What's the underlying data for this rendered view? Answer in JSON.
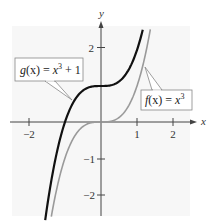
{
  "chart_data": {
    "type": "line",
    "title": "",
    "xlabel": "x",
    "ylabel": "y",
    "xlim": [
      -2.5,
      2.6
    ],
    "ylim": [
      -2.5,
      2.8
    ],
    "x_ticks": [
      -2,
      1,
      2
    ],
    "x_tick_labels": [
      "−2",
      "1",
      "2"
    ],
    "y_ticks": [
      2,
      -1,
      -2
    ],
    "y_tick_labels": [
      "2",
      "−1",
      "−2"
    ],
    "grid": false,
    "series": [
      {
        "name": "g(x) = x³ + 1",
        "formula": "x^3 + 1",
        "color": "#111111",
        "style": "solid-bold",
        "x": [
          -1.55,
          -1.26,
          -1,
          -0.5,
          0,
          0.5,
          1,
          1.16
        ],
        "y": [
          -2.72,
          -1.0,
          0,
          0.875,
          1,
          1.125,
          2,
          2.56
        ]
      },
      {
        "name": "f(x) = x³",
        "formula": "x^3",
        "color": "#999999",
        "style": "solid",
        "x": [
          -1.38,
          -1,
          -0.5,
          0,
          0.5,
          1,
          1.37
        ],
        "y": [
          -2.63,
          -1,
          -0.125,
          0,
          0.125,
          1,
          2.57
        ]
      }
    ],
    "annotations": [
      {
        "text": "g(x) = x³ + 1",
        "points_to": "g",
        "position": "upper-left"
      },
      {
        "text": "f(x) = x³",
        "points_to": "f",
        "position": "right"
      }
    ]
  },
  "labels": {
    "x_axis": "x",
    "y_axis": "y",
    "x_tick_neg2": "−2",
    "x_tick_1": "1",
    "x_tick_2": "2",
    "y_tick_2": "2",
    "y_tick_neg1": "−1",
    "y_tick_neg2": "−2"
  },
  "annotations": {
    "g": {
      "fn": "g",
      "arg": "(x) = ",
      "var": "x",
      "exp": "3",
      "rest": " + 1"
    },
    "f": {
      "fn": "f",
      "arg": "(x) = ",
      "var": "x",
      "exp": "3"
    }
  },
  "colors": {
    "g_curve": "#111111",
    "f_curve": "#9a9a9a",
    "axes": "#444444",
    "plot_bg": "#f7f7f7"
  }
}
